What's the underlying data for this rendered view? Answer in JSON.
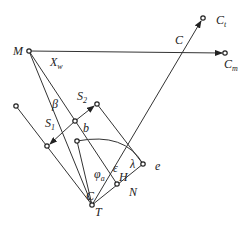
{
  "figure": {
    "type": "geometric-diagram",
    "labels": {
      "M": "M",
      "Xw": {
        "main": "X",
        "sub": "w"
      },
      "C_top": "C",
      "Ct": {
        "main": "C",
        "sub": "t"
      },
      "Cm": {
        "main": "C",
        "sub": "m"
      },
      "beta": "β",
      "S2": {
        "main": "S",
        "sub": "2"
      },
      "S1": {
        "main": "S",
        "sub": "1"
      },
      "b": "b",
      "phi_a": {
        "main": "φ",
        "sub": "a"
      },
      "epsilon": "ε",
      "H": "H",
      "lambda": "λ",
      "e": "e",
      "N": "N",
      "C_bottom": "C",
      "T": "T"
    },
    "points": {
      "M": [
        29,
        51
      ],
      "Cm": [
        225,
        53
      ],
      "Ct": [
        203,
        18
      ],
      "T": [
        92,
        205
      ],
      "S2": [
        97,
        104
      ],
      "bmid": [
        75,
        121
      ],
      "S1": [
        47,
        146
      ],
      "left_end": [
        16,
        106
      ],
      "arc_start": [
        77,
        141
      ],
      "e": [
        143,
        164
      ],
      "H": [
        117,
        184
      ]
    },
    "line_color": "#333333",
    "background": "#ffffff"
  }
}
